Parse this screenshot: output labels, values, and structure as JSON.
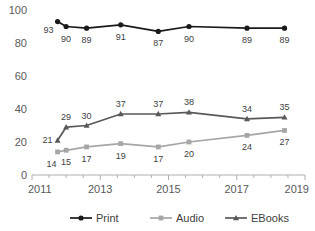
{
  "chart_data": {
    "type": "line",
    "title": "",
    "xlabel": "",
    "ylabel": "",
    "x": [
      2011.75,
      2012.0,
      2012.6,
      2013.6,
      2014.7,
      2015.6,
      2017.3,
      2018.4
    ],
    "xtick_labels": [
      "2011",
      "2013",
      "2015",
      "2017",
      "2019"
    ],
    "xtick_values": [
      2011,
      2013,
      2015,
      2017,
      2019
    ],
    "xlim": [
      2011,
      2019
    ],
    "ytick_labels": [
      "0",
      "20",
      "40",
      "60",
      "80",
      "100"
    ],
    "ytick_values": [
      0,
      20,
      40,
      60,
      80,
      100
    ],
    "ylim": [
      0,
      100
    ],
    "grid": false,
    "legend_position": "bottom",
    "series": [
      {
        "name": "Print",
        "color": "#1a1a1a",
        "marker": "circle",
        "values": [
          93,
          90,
          89,
          91,
          87,
          90,
          89,
          89
        ],
        "label_position": "below"
      },
      {
        "name": "Audio",
        "color": "#a6a6a6",
        "marker": "square",
        "values": [
          14,
          15,
          17,
          19,
          17,
          20,
          24,
          27
        ],
        "label_position": "below"
      },
      {
        "name": "EBooks",
        "color": "#595959",
        "marker": "triangle",
        "values": [
          21,
          29,
          30,
          37,
          37,
          38,
          34,
          35
        ],
        "label_position": "above"
      }
    ]
  },
  "legend": {
    "items": [
      {
        "label": "Print"
      },
      {
        "label": "Audio"
      },
      {
        "label": "EBooks"
      }
    ]
  }
}
